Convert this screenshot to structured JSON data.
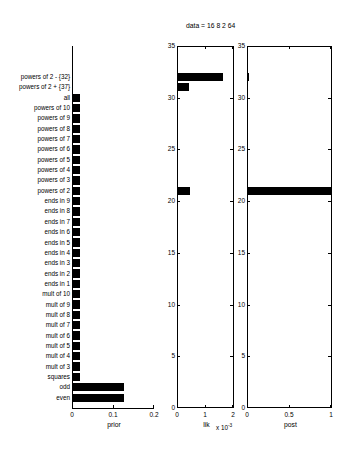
{
  "figure": {
    "width": 338,
    "height": 461,
    "background": "#ffffff",
    "bar_color": "#000000",
    "axis_color": "#000000",
    "title": "data = 16  8  2  64"
  },
  "categories": [
    "even",
    "odd",
    "squares",
    "mult of 3",
    "mult of 4",
    "mult of 5",
    "mult of 6",
    "mult of 7",
    "mult of 8",
    "mult of 9",
    "mult of 10",
    "ends in 1",
    "ends in 2",
    "ends in 3",
    "ends in 4",
    "ends in 5",
    "ends in 6",
    "ends in 7",
    "ends in 8",
    "ends in 9",
    "powers of 2",
    "powers of 3",
    "powers of 4",
    "powers of 5",
    "powers of 6",
    "powers of 7",
    "powers of 8",
    "powers of 9",
    "powers of 10",
    "all",
    "powers of 2 + {37}",
    "powers of 2 - {32}"
  ],
  "chart_data": [
    {
      "type": "bar",
      "orientation": "horizontal",
      "name": "prior",
      "title": "",
      "xlabel": "prior",
      "ylabel": "",
      "xlim": [
        0,
        0.2
      ],
      "xticks": [
        0,
        0.1,
        0.2
      ],
      "xticklabels": [
        "0",
        "0.1",
        "0.2"
      ],
      "yticks": [],
      "yticklabels": [],
      "grid": false,
      "categories": [
        "even",
        "odd",
        "squares",
        "mult of 3",
        "mult of 4",
        "mult of 5",
        "mult of 6",
        "mult of 7",
        "mult of 8",
        "mult of 9",
        "mult of 10",
        "ends in 1",
        "ends in 2",
        "ends in 3",
        "ends in 4",
        "ends in 5",
        "ends in 6",
        "ends in 7",
        "ends in 8",
        "ends in 9",
        "powers of 2",
        "powers of 3",
        "powers of 4",
        "powers of 5",
        "powers of 6",
        "powers of 7",
        "powers of 8",
        "powers of 9",
        "powers of 10",
        "all",
        "powers of 2 + {37}",
        "powers of 2 - {32}"
      ],
      "values": [
        0.1239,
        0.1239,
        0.0164,
        0.0164,
        0.0164,
        0.0164,
        0.0164,
        0.0164,
        0.0164,
        0.0164,
        0.0164,
        0.0164,
        0.0164,
        0.0164,
        0.0164,
        0.0164,
        0.0164,
        0.0164,
        0.0164,
        0.0164,
        0.0164,
        0.0164,
        0.0164,
        0.0164,
        0.0164,
        0.0164,
        0.0164,
        0.0164,
        0.0164,
        0.0164,
        0.0,
        0.0
      ]
    },
    {
      "type": "bar",
      "orientation": "horizontal",
      "name": "lik",
      "title": "",
      "xlabel": "lik",
      "ylabel": "",
      "exponent_label": "x 10",
      "exponent_value": "-3",
      "xlim": [
        0,
        2
      ],
      "xticks": [
        0,
        1,
        2
      ],
      "xticklabels": [
        "0",
        "1",
        "2"
      ],
      "ylim": [
        0,
        35
      ],
      "yticks": [
        0,
        5,
        10,
        15,
        20,
        25,
        30,
        35
      ],
      "yticklabels": [
        "0",
        "5",
        "10",
        "15",
        "20",
        "25",
        "30",
        "35"
      ],
      "grid": false,
      "categories": [
        "even",
        "odd",
        "squares",
        "mult of 3",
        "mult of 4",
        "mult of 5",
        "mult of 6",
        "mult of 7",
        "mult of 8",
        "mult of 9",
        "mult of 10",
        "ends in 1",
        "ends in 2",
        "ends in 3",
        "ends in 4",
        "ends in 5",
        "ends in 6",
        "ends in 7",
        "ends in 8",
        "ends in 9",
        "powers of 2",
        "powers of 3",
        "powers of 4",
        "powers of 5",
        "powers of 6",
        "powers of 7",
        "powers of 8",
        "powers of 9",
        "powers of 10",
        "all",
        "powers of 2 + {37}",
        "powers of 2 - {32}"
      ],
      "values": [
        0,
        0,
        0,
        0,
        0,
        0,
        0,
        0,
        0,
        0,
        0,
        0,
        0,
        0,
        0,
        0,
        0,
        0,
        0,
        0,
        0.44,
        0,
        0,
        0,
        0,
        0,
        0,
        0,
        0,
        0,
        0.4,
        1.6
      ]
    },
    {
      "type": "bar",
      "orientation": "horizontal",
      "name": "post",
      "title": "",
      "xlabel": "post",
      "ylabel": "",
      "xlim": [
        0,
        1
      ],
      "xticks": [
        0,
        0.5,
        1
      ],
      "xticklabels": [
        "0",
        "0.5",
        "1"
      ],
      "ylim": [
        0,
        35
      ],
      "yticks": [
        0,
        5,
        10,
        15,
        20,
        25,
        30,
        35
      ],
      "yticklabels": [
        "0",
        "5",
        "10",
        "15",
        "20",
        "25",
        "30",
        "35"
      ],
      "grid": false,
      "categories": [
        "even",
        "odd",
        "squares",
        "mult of 3",
        "mult of 4",
        "mult of 5",
        "mult of 6",
        "mult of 7",
        "mult of 8",
        "mult of 9",
        "mult of 10",
        "ends in 1",
        "ends in 2",
        "ends in 3",
        "ends in 4",
        "ends in 5",
        "ends in 6",
        "ends in 7",
        "ends in 8",
        "ends in 9",
        "powers of 2",
        "powers of 3",
        "powers of 4",
        "powers of 5",
        "powers of 6",
        "powers of 7",
        "powers of 8",
        "powers of 9",
        "powers of 10",
        "all",
        "powers of 2 + {37}",
        "powers of 2 - {32}"
      ],
      "values": [
        0,
        0,
        0,
        0,
        0,
        0,
        0,
        0,
        0,
        0,
        0,
        0,
        0,
        0,
        0,
        0,
        0,
        0,
        0,
        0,
        0.985,
        0,
        0,
        0,
        0,
        0,
        0,
        0,
        0,
        0,
        0,
        0.012
      ]
    }
  ]
}
